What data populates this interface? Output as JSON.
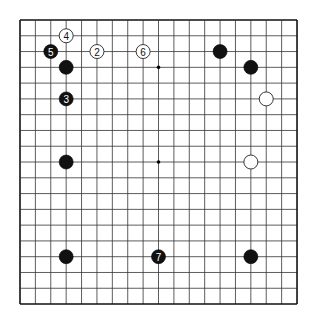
{
  "board": {
    "size": 19,
    "origin_x": 20,
    "origin_y": 20,
    "spacing_x": 15.39,
    "spacing_y": 15.78,
    "line_color": "#333333",
    "border_color": "#111111",
    "background": "#ffffff",
    "hoshi_visible": [
      [
        9,
        3
      ],
      [
        9,
        9
      ]
    ]
  },
  "stones": [
    {
      "color": "black",
      "col": 3,
      "row": 3,
      "label": ""
    },
    {
      "color": "black",
      "col": 13,
      "row": 2,
      "label": ""
    },
    {
      "color": "black",
      "col": 15,
      "row": 3,
      "label": ""
    },
    {
      "color": "black",
      "col": 3,
      "row": 9,
      "label": ""
    },
    {
      "color": "black",
      "col": 3,
      "row": 15,
      "label": ""
    },
    {
      "color": "black",
      "col": 15,
      "row": 15,
      "label": ""
    },
    {
      "color": "white",
      "col": 16,
      "row": 5,
      "label": ""
    },
    {
      "color": "white",
      "col": 15,
      "row": 9,
      "label": ""
    },
    {
      "color": "white",
      "col": 5,
      "row": 2,
      "label": "2"
    },
    {
      "color": "black",
      "col": 3,
      "row": 5,
      "label": "3"
    },
    {
      "color": "white",
      "col": 3,
      "row": 1,
      "label": "4"
    },
    {
      "color": "black",
      "col": 2,
      "row": 2,
      "label": "5"
    },
    {
      "color": "white",
      "col": 8,
      "row": 2,
      "label": "6"
    },
    {
      "color": "black",
      "col": 9,
      "row": 15,
      "label": "7"
    }
  ]
}
